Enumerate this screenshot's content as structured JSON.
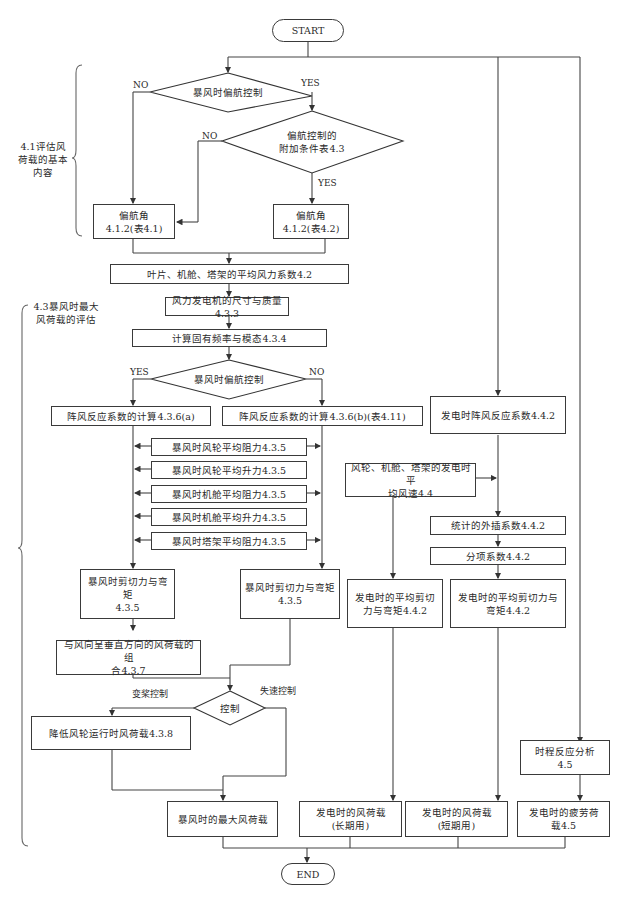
{
  "diagram": {
    "type": "flowchart",
    "start": "START",
    "end": "END",
    "side_labels": {
      "basic": "4.1评估风\n荷载的基本\n内容",
      "storm": "4.3暴风时最大\n风荷载的评估"
    },
    "branch_labels": {
      "no1": "NO",
      "yes1": "YES",
      "no2": "NO",
      "yes2": "YES",
      "yes3": "YES",
      "no3": "NO",
      "pitch": "变桨控制",
      "stall": "失速控制"
    },
    "decisions": {
      "yaw_control_1": "暴风时偏航控制",
      "yaw_extra": "偏航控制的\n附加条件表4.3",
      "yaw_control_2": "暴风时偏航控制",
      "control": "控制"
    },
    "boxes": {
      "yaw_angle_1": "偏航角\n4.1.2(表4.1)",
      "yaw_angle_2": "偏航角\n4.1.2(表4.2)",
      "mean_force_coef": "叶片、机舱、塔架的平均风力系数4.2",
      "size_mass": "风力发电机的尺寸与质量4.3.3",
      "natural_freq": "计算固有频率与模态4.3.4",
      "gust_a": "阵风反应系数的计算4.3.6(a)",
      "gust_b": "阵风反应系数的计算4.3.6(b)(表4.11)",
      "rotor_drag": "暴风时风轮平均阻力4.3.5",
      "rotor_lift": "暴风时风轮平均升力4.3.5",
      "nacelle_drag": "暴风时机舱平均阻力4.3.5",
      "nacelle_lift": "暴风时机舱平均升力4.3.5",
      "tower_drag": "暴风时塔架平均阻力4.3.5",
      "shear_moment_a": "暴风时剪切力与弯矩\n4.3.5",
      "shear_moment_b": "暴风时剪切力与弯矩\n4.3.5",
      "perpendicular_combo": "与风向呈垂直方向的风荷载的组\n合4.3.7",
      "reduce_rotor_load": "降低风轮运行时风荷载4.3.8",
      "max_storm_load": "暴风时的最大风荷载",
      "gen_gust_coef": "发电时阵风反应系数4.4.2",
      "gen_mean_wind": "风轮、机舱、塔架的发电时平\n均风速4.4",
      "extrapolation": "统计的外插系数4.4.2",
      "partial_coef": "分项系数4.4.2",
      "gen_shear_1": "发电时的平均剪切\n力与弯矩4.4.2",
      "gen_shear_2": "发电时的平均剪切力与\n弯矩4.4.2",
      "time_history": "时程反应分析\n4.5",
      "gen_load_long": "发电时的风荷载\n(长期用)",
      "gen_load_short": "发电时的风荷载\n(短期用)",
      "fatigue_load": "发电时的疲劳荷\n载4.5"
    }
  }
}
